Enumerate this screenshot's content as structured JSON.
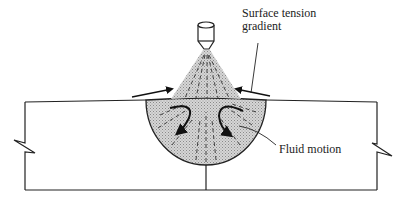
{
  "diagram": {
    "type": "cross-section schematic",
    "labels": {
      "surface_tension_line1": "Surface tension",
      "surface_tension_line2": "gradient",
      "fluid_motion": "Fluid motion"
    },
    "colors": {
      "line": "#222222",
      "fill_shade": "#bdbdbd",
      "background": "#ffffff"
    },
    "elements": [
      "electrode",
      "arc-plasma-cone",
      "workpiece-plate",
      "weld-pool",
      "surface-flow-arrows",
      "recirculation-arrows",
      "break-marks",
      "joint-line"
    ]
  }
}
